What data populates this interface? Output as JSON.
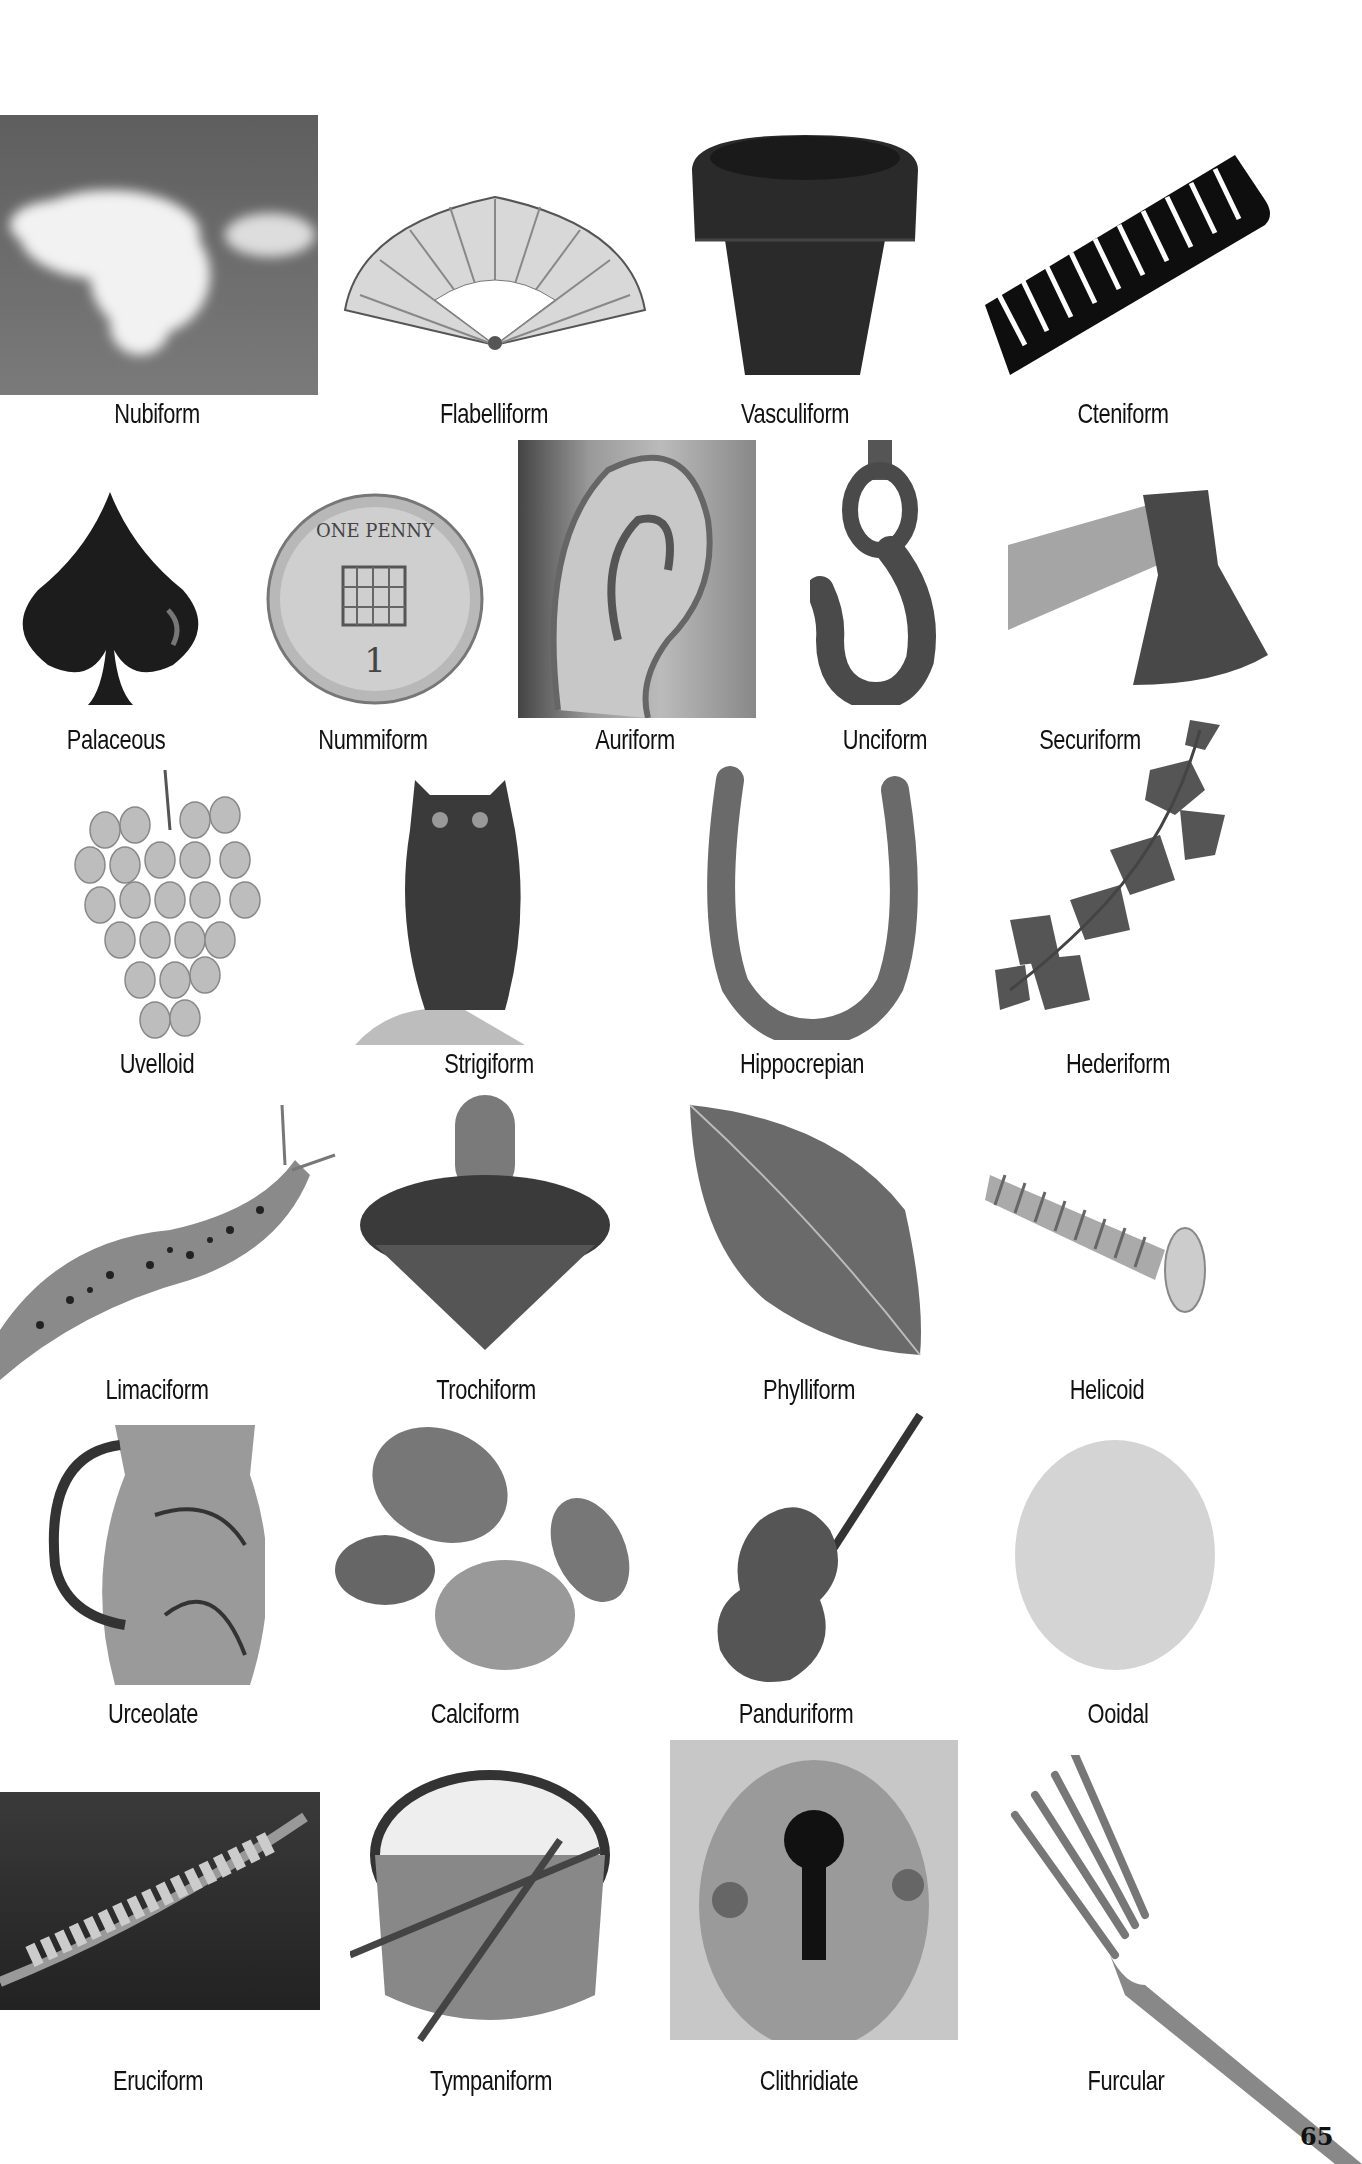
{
  "page": {
    "page_number": "65",
    "rows": [
      {
        "items": [
          {
            "label": "Nubiform",
            "depicts": "cloud"
          },
          {
            "label": "Flabelliform",
            "depicts": "folding fan"
          },
          {
            "label": "Vasculiform",
            "depicts": "flower pot"
          },
          {
            "label": "Cteniform",
            "depicts": "comb"
          }
        ]
      },
      {
        "items": [
          {
            "label": "Palaceous",
            "depicts": "spade"
          },
          {
            "label": "Nummiform",
            "depicts": "one penny coin"
          },
          {
            "label": "Auriform",
            "depicts": "ear"
          },
          {
            "label": "Unciform",
            "depicts": "hook"
          },
          {
            "label": "Securiform",
            "depicts": "axe"
          }
        ]
      },
      {
        "items": [
          {
            "label": "Uvelloid",
            "depicts": "grapes"
          },
          {
            "label": "Strigiform",
            "depicts": "owl"
          },
          {
            "label": "Hippocrepian",
            "depicts": "horseshoe"
          },
          {
            "label": "Hederiform",
            "depicts": "ivy"
          }
        ]
      },
      {
        "items": [
          {
            "label": "Limaciform",
            "depicts": "slug"
          },
          {
            "label": "Trochiform",
            "depicts": "spinning top"
          },
          {
            "label": "Phylliform",
            "depicts": "leaf"
          },
          {
            "label": "Helicoid",
            "depicts": "screw"
          }
        ]
      },
      {
        "items": [
          {
            "label": "Urceolate",
            "depicts": "pitcher"
          },
          {
            "label": "Calciform",
            "depicts": "pebbles"
          },
          {
            "label": "Panduriform",
            "depicts": "violin"
          },
          {
            "label": "Ooidal",
            "depicts": "egg"
          }
        ]
      },
      {
        "items": [
          {
            "label": "Eruciform",
            "depicts": "caterpillar"
          },
          {
            "label": "Tympaniform",
            "depicts": "drum"
          },
          {
            "label": "Clithridiate",
            "depicts": "keyhole"
          },
          {
            "label": "Furcular",
            "depicts": "fork"
          }
        ]
      }
    ],
    "coin_text": "ONE PENNY",
    "coin_value": "1"
  }
}
